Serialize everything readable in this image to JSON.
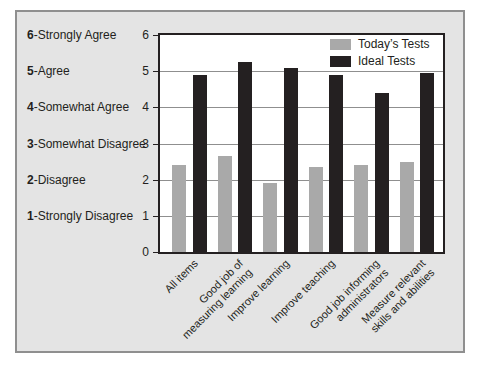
{
  "figure": {
    "background": "#ffffff",
    "panel_background": "#e4e4e4",
    "panel_border_color": "#8f8f8f",
    "plot_background": "#ffffff",
    "plot_border_color": "#242021",
    "gridline_color": "#8f8f8f",
    "text_color": "#231f20"
  },
  "scale": [
    {
      "num": "6",
      "label": "Strongly Agree"
    },
    {
      "num": "5",
      "label": "Agree"
    },
    {
      "num": "4",
      "label": "Somewhat Agree"
    },
    {
      "num": "3",
      "label": "Somewhat Disagree"
    },
    {
      "num": "2",
      "label": "Disagree"
    },
    {
      "num": "1",
      "label": "Strongly Disagree"
    }
  ],
  "chart_data": {
    "type": "bar",
    "categories": [
      "All items",
      "Good job of\nmeasuring learning",
      "Improve learning",
      "Improve teaching",
      "Good job informing\nadministrators",
      "Measure relevant\nskills and abilities"
    ],
    "series": [
      {
        "name": "Today’s Tests",
        "color": "#a9a9a9",
        "values": [
          2.4,
          2.65,
          1.9,
          2.35,
          2.4,
          2.5
        ]
      },
      {
        "name": "Ideal Tests",
        "color": "#242021",
        "values": [
          4.9,
          5.25,
          5.1,
          4.9,
          4.4,
          4.95
        ]
      }
    ],
    "title": "",
    "xlabel": "",
    "ylabel": "",
    "ylim": [
      0,
      6
    ],
    "yticks": [
      0,
      1,
      2,
      3,
      4,
      5,
      6
    ],
    "grid": true,
    "legend_position": "top-right"
  }
}
